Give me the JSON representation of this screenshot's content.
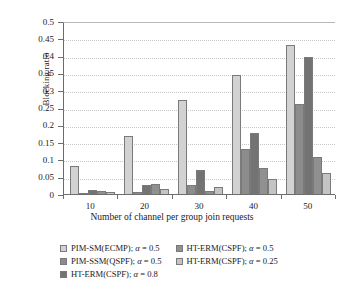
{
  "chart_data": {
    "type": "bar",
    "title": "",
    "xlabel": "Number of channel per group join requests",
    "ylabel": "Blocking ratio",
    "categories": [
      "10",
      "20",
      "30",
      "40",
      "50"
    ],
    "ylim": [
      0,
      0.5
    ],
    "yticks": [
      "0",
      "0.05",
      "0.1",
      "0.15",
      "0.2",
      "0.25",
      "0.3",
      "0.35",
      "0.4",
      "0.45",
      "0.5"
    ],
    "ytick_values": [
      0,
      0.05,
      0.1,
      0.15,
      0.2,
      0.25,
      0.3,
      0.35,
      0.4,
      0.45,
      0.5
    ],
    "grid": true,
    "legend_position": "bottom",
    "series": [
      {
        "name": "PIM-SM(ECMP); α = 0.5",
        "color": "#d2d2d2",
        "values": [
          0.08,
          0.167,
          0.271,
          0.345,
          0.43
        ]
      },
      {
        "name": "PIM-SSM(QSPF); α = 0.5",
        "color": "#8c8c8c",
        "values": [
          0.004,
          0.007,
          0.026,
          0.13,
          0.26
        ]
      },
      {
        "name": "HT-ERM(CSPF); α = 0.8",
        "color": "#737373",
        "values": [
          0.012,
          0.026,
          0.07,
          0.177,
          0.395
        ]
      },
      {
        "name": "HT-ERM(CSPF); α = 0.5",
        "color": "#909090",
        "values": [
          0.009,
          0.03,
          0.009,
          0.075,
          0.108
        ]
      },
      {
        "name": "HT-ERM(CSPF); α = 0.25",
        "color": "#c4c4c4",
        "values": [
          0.007,
          0.015,
          0.02,
          0.043,
          0.06
        ]
      }
    ]
  },
  "legend": {
    "columns": [
      [
        {
          "label": "PIM-SM(ECMP); α = 0.5",
          "color": "#d2d2d2"
        },
        {
          "label": "PIM-SSM(QSPF); α = 0.5",
          "color": "#8c8c8c"
        },
        {
          "label": "HT-ERM(CSPF); α = 0.8",
          "color": "#737373"
        }
      ],
      [
        {
          "label": "HT-ERM(CSPF); α = 0.5",
          "color": "#909090"
        },
        {
          "label": "HT-ERM(CSPF); α = 0.25",
          "color": "#c4c4c4"
        }
      ]
    ]
  }
}
